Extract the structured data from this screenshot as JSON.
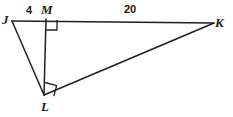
{
  "figure": {
    "stroke_color": "#231f20",
    "background_color": "#ffffff",
    "stroke_width": 1.4,
    "vertices": [
      {
        "id": "J",
        "label": "J",
        "x": 12,
        "y": 21
      },
      {
        "id": "M",
        "label": "M",
        "x": 46,
        "y": 19
      },
      {
        "id": "K",
        "label": "K",
        "x": 214,
        "y": 23
      },
      {
        "id": "L",
        "label": "L",
        "x": 44,
        "y": 95
      }
    ],
    "segments": [
      {
        "id": "JK",
        "from": "J",
        "to": "K"
      },
      {
        "id": "JL",
        "from": "J",
        "to": "L"
      },
      {
        "id": "ML",
        "from": "M",
        "to": "L"
      },
      {
        "id": "LK",
        "from": "L",
        "to": "K"
      }
    ],
    "measures": [
      {
        "id": "JM",
        "segment": "JM",
        "value": "4",
        "x": 26,
        "y": 5
      },
      {
        "id": "MK",
        "segment": "MK",
        "value": "20",
        "x": 124,
        "y": 4
      }
    ],
    "right_angles": [
      {
        "id": "angle-JML",
        "at": "M",
        "points": "46,19 57,19 57,30 46,30"
      },
      {
        "id": "angle-MLK",
        "at": "L",
        "points": "44,95 45,82 57,85 56,96"
      }
    ]
  }
}
